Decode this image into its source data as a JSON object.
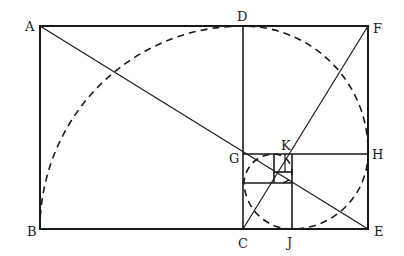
{
  "diagram": {
    "labels": {
      "A": "A",
      "B": "B",
      "C": "C",
      "D": "D",
      "E": "E",
      "F": "F",
      "G": "G",
      "H": "H",
      "J": "J",
      "K": "K"
    },
    "points": {
      "A": [
        40,
        26
      ],
      "B": [
        40,
        229
      ],
      "C": [
        243,
        229
      ],
      "D": [
        243,
        26
      ],
      "E": [
        368,
        229
      ],
      "F": [
        368,
        26
      ],
      "G": [
        243,
        154
      ],
      "H": [
        368,
        154
      ],
      "J": [
        292,
        229
      ],
      "K": [
        292,
        154
      ]
    },
    "diagonals": [
      {
        "from": "A",
        "to": "E"
      },
      {
        "from": "F",
        "to": "C"
      }
    ],
    "colors": {
      "ink": "#1a1a1a",
      "background": "#ffffff"
    }
  }
}
